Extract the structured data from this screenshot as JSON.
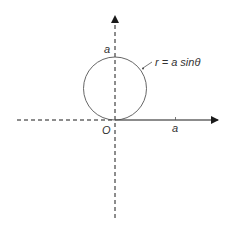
{
  "diagram": {
    "curve_label": "r = a sinθ",
    "y_tick_label": "a",
    "x_tick_label": "a",
    "origin_label": "O",
    "colors": {
      "axis": "#1a1a1a",
      "curve": "#555555",
      "text": "#333333"
    }
  }
}
